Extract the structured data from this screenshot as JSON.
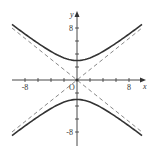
{
  "chart_data": {
    "type": "line",
    "title": "",
    "xlabel": "x",
    "ylabel": "y",
    "origin_label": "O",
    "xlim": [
      -10,
      10.5
    ],
    "ylim": [
      -9,
      10.5
    ],
    "x_tick_labels": [
      {
        "value": -8,
        "label": "-8"
      },
      {
        "value": 8,
        "label": "8"
      }
    ],
    "y_tick_labels": [
      {
        "value": 8,
        "label": "8"
      },
      {
        "value": -8,
        "label": "-8"
      }
    ],
    "x_ticks": [
      -8,
      -6,
      -4,
      -2,
      2,
      4,
      6,
      8
    ],
    "y_ticks": [
      -8,
      -6,
      -4,
      -2,
      2,
      4,
      6,
      8
    ],
    "grid": false,
    "series": [
      {
        "name": "hyperbola upper branch",
        "style": "solid",
        "equation": "y^2/9 - x^2/14.06 = 1, y>0",
        "vertex": [
          0,
          3
        ],
        "x": [
          -10,
          -8,
          -6,
          -4,
          -2,
          0,
          2,
          4,
          6,
          8,
          10
        ],
        "values": [
          8.54,
          7.07,
          5.66,
          4.39,
          3.4,
          3.0,
          3.4,
          4.39,
          5.66,
          7.07,
          8.54
        ]
      },
      {
        "name": "hyperbola lower branch",
        "style": "solid",
        "equation": "y^2/9 - x^2/14.06 = 1, y<0",
        "vertex": [
          0,
          -3
        ],
        "x": [
          -10,
          -8,
          -6,
          -4,
          -2,
          0,
          2,
          4,
          6,
          8,
          10
        ],
        "values": [
          -8.54,
          -7.07,
          -5.66,
          -4.39,
          -3.4,
          -3.0,
          -3.4,
          -4.39,
          -5.66,
          -7.07,
          -8.54
        ]
      },
      {
        "name": "asymptote y = 0.8x",
        "style": "dashed",
        "x": [
          -10,
          10
        ],
        "values": [
          -8,
          8
        ]
      },
      {
        "name": "asymptote y = -0.8x",
        "style": "dashed",
        "x": [
          -10,
          10
        ],
        "values": [
          8,
          -8
        ]
      }
    ],
    "legend": null
  },
  "colors": {
    "curve": "#333333",
    "asymptote": "#888888",
    "axis": "#333333",
    "background": "#ffffff"
  }
}
